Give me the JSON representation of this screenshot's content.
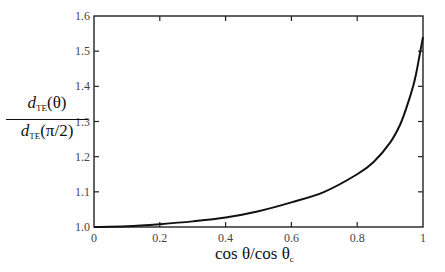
{
  "chart_data": {
    "type": "line",
    "title": "",
    "xlabel": {
      "main": "cos θ/cos θ",
      "subscript": "c"
    },
    "ylabel": {
      "numerator_var": "d",
      "numerator_sub": "TE",
      "numerator_arg": "(θ)",
      "denominator_var": "d",
      "denominator_sub": "TE",
      "denominator_arg": "(π/2)"
    },
    "xlim": [
      0,
      1
    ],
    "ylim": [
      1.0,
      1.6
    ],
    "x_ticks": [
      0,
      0.2,
      0.4,
      0.6,
      0.8,
      1
    ],
    "x_tick_labels": [
      "0",
      "0.2",
      "0.4",
      "0.6",
      "0.8",
      "1"
    ],
    "y_ticks": [
      1.0,
      1.1,
      1.2,
      1.3,
      1.4,
      1.5,
      1.6
    ],
    "y_tick_labels": [
      "1.0",
      "1.1",
      "1.2",
      "1.3",
      "1.4",
      "1.5",
      "1.6"
    ],
    "grid": false,
    "legend": "none",
    "series": [
      {
        "name": "d_TE ratio",
        "color": "#111111",
        "x": [
          0,
          0.1,
          0.2,
          0.3,
          0.4,
          0.5,
          0.6,
          0.7,
          0.8,
          0.85,
          0.9,
          0.93,
          0.95,
          0.97,
          0.98,
          0.99,
          1.0
        ],
        "y": [
          1.0,
          1.002,
          1.008,
          1.016,
          1.027,
          1.045,
          1.07,
          1.1,
          1.15,
          1.185,
          1.24,
          1.29,
          1.34,
          1.4,
          1.44,
          1.49,
          1.54
        ]
      }
    ]
  }
}
